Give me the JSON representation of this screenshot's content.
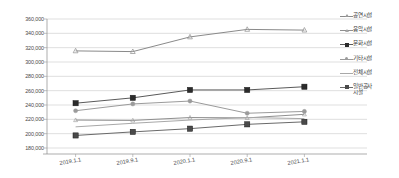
{
  "chart_data": {
    "type": "line",
    "title": "",
    "xlabel": "",
    "ylabel": "",
    "x": [
      "2019.1.1",
      "2019.9.1",
      "2020.1.1",
      "2020.9.1",
      "2021.1.1"
    ],
    "categories": [
      "2019.1.1",
      "2019.9.1",
      "2020.1.1",
      "2020.9.1",
      "2021.1.1"
    ],
    "ylim": [
      180000,
      360000
    ],
    "ytick_labels": [
      "360,000",
      "340,000",
      "320,000",
      "300,000",
      "280,000",
      "260,000",
      "240,000",
      "220,000",
      "200,000",
      "180,000"
    ],
    "ytick_values": [
      360000,
      340000,
      320000,
      300000,
      280000,
      260000,
      240000,
      220000,
      200000,
      180000
    ],
    "grid": true,
    "legend_position": "right",
    "series": [
      {
        "name": "공연시설",
        "color": "#8a8a8a",
        "marker": "triangle",
        "marker_color": "#9a9a9a",
        "values": [
          315500,
          314500,
          335000,
          345500,
          344500
        ]
      },
      {
        "name": "음악시설",
        "color": "#8f8f8f",
        "marker": "triangle-small",
        "marker_color": "#a5a5a5",
        "values": [
          219000,
          218500,
          222500,
          222000,
          227000
        ]
      },
      {
        "name": "문화시설",
        "color": "#5a5a5a",
        "marker": "square-filled",
        "marker_color": "#2b2b2b",
        "values": [
          242500,
          250000,
          261000,
          261000,
          265500
        ]
      },
      {
        "name": "기타시설",
        "color": "#9b9b9b",
        "marker": "circle",
        "marker_color": "#9b9b9b",
        "values": [
          232000,
          241500,
          245500,
          228500,
          231000
        ]
      },
      {
        "name": "전체시설",
        "color": "#a8a8a8",
        "marker": "none",
        "marker_color": "#a8a8a8",
        "values": [
          209500,
          214500,
          219000,
          222500,
          221000
        ]
      },
      {
        "name": "일반공사\n시설",
        "color": "#6a6a6a",
        "marker": "square-filled",
        "marker_color": "#4a4a4a",
        "values": [
          197500,
          202500,
          207000,
          213000,
          216500
        ]
      }
    ]
  },
  "axes": {
    "y_min_label": "180,000",
    "y_max_label": "360,000"
  }
}
